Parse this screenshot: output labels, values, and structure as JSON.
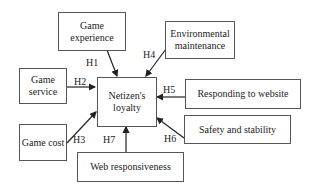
{
  "diagram": {
    "center": {
      "label": "Netizen's loyalty"
    },
    "nodes": [
      {
        "id": "game_experience",
        "label": "Game experience"
      },
      {
        "id": "environmental_maintenance",
        "label": "Environmental maintenance"
      },
      {
        "id": "game_service",
        "label": "Game service"
      },
      {
        "id": "responding_to_website",
        "label": "Responding to website"
      },
      {
        "id": "game_cost",
        "label": "Game cost"
      },
      {
        "id": "safety_and_stability",
        "label": "Safety and stability"
      },
      {
        "id": "web_responsiveness",
        "label": "Web responsiveness"
      }
    ],
    "hypotheses": [
      "H1",
      "H2",
      "H3",
      "H4",
      "H5",
      "H6",
      "H7"
    ]
  }
}
